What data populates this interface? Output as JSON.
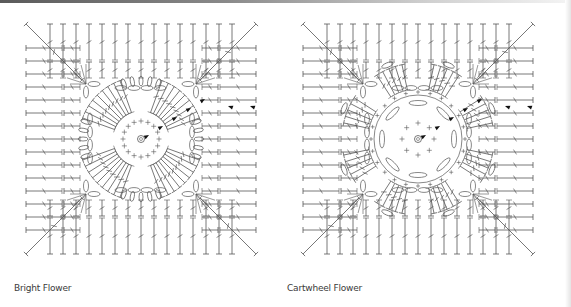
{
  "charts": [
    {
      "id": "bright-flower",
      "caption": "Bright Flower",
      "left": 10,
      "size": 262,
      "center_style": "square-petals",
      "petal_count": 4,
      "caption_left": 14
    },
    {
      "id": "cartwheel-flower",
      "caption": "Cartwheel Flower",
      "left": 287,
      "size": 262,
      "center_style": "circle-cartwheel",
      "petal_count": 8,
      "caption_left": 287
    }
  ],
  "symbols": {
    "stroke_color": "#555555",
    "accent_color": "#111111",
    "grid_columns": 17,
    "outer_row_icon": "treble-crochet-icon",
    "border_row_icon": "double-crochet-icon",
    "center_icon": "magic-ring-icon",
    "chain_icon": "chain-oval-icon",
    "start_marker_icon": "arrowhead-icon"
  }
}
